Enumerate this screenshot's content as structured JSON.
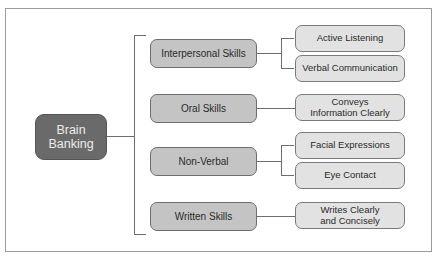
{
  "diagram": {
    "root": {
      "label": "Brain\nBanking",
      "line1": "Brain",
      "line2": "Banking"
    },
    "branches": [
      {
        "label": "Interpersonal Skills",
        "children": [
          {
            "label": "Active Listening"
          },
          {
            "label": "Verbal Communication"
          }
        ]
      },
      {
        "label": "Oral Skills",
        "children": [
          {
            "line1": "Conveys",
            "line2": "Information Clearly"
          }
        ]
      },
      {
        "label": "Non-Verbal",
        "children": [
          {
            "label": "Facial Expressions"
          },
          {
            "label": "Eye Contact"
          }
        ]
      },
      {
        "label": "Written Skills",
        "children": [
          {
            "line1": "Writes Clearly",
            "line2": "and Concisely"
          }
        ]
      }
    ]
  },
  "colors": {
    "root_fill": "#6a6a6a",
    "branch_fill": "#c4c4c4",
    "leaf_fill": "#e2e2e2",
    "line": "#6e6e6e"
  }
}
